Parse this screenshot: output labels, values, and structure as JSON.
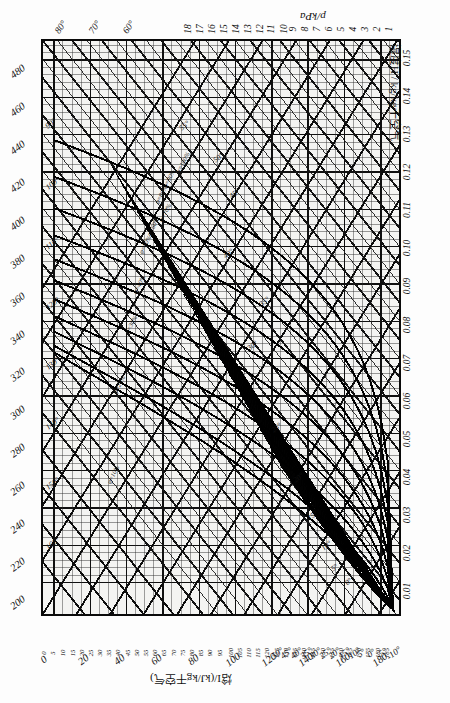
{
  "chart_data": {
    "type": "line",
    "orientation": "rotated-90-ccw",
    "axes": {
      "enthalpy": {
        "symbol": "I",
        "label": "焓I/(kJ/kg干空气)",
        "unit": "kJ/kg干空气",
        "major_ticks_left": [
          200,
          220,
          240,
          260,
          280,
          300,
          320,
          340,
          360,
          380,
          400,
          420,
          440,
          460,
          480
        ],
        "bottom_big_ticks": [
          180,
          160,
          140,
          120,
          100,
          80,
          60,
          40,
          20,
          0
        ],
        "bottom_small_ladder": [
          185,
          180,
          175,
          170,
          165,
          160,
          155,
          150,
          145,
          140,
          135,
          130,
          125,
          120,
          115,
          110,
          105,
          100,
          95,
          90,
          85,
          80,
          75,
          70,
          65,
          60,
          55,
          50,
          45,
          40,
          35,
          30,
          25,
          20,
          15,
          10,
          5,
          0
        ],
        "range": [
          0,
          490
        ]
      },
      "humidity": {
        "symbol": "H",
        "label": "湿度H / kg/kg干空气",
        "unit": "kg/kg干空气",
        "ticks": [
          "0.01",
          "0.02",
          "0.03",
          "0.04",
          "0.05",
          "0.06",
          "0.07",
          "0.08",
          "0.09",
          "0.10",
          "0.11",
          "0.12",
          "0.13",
          "0.14",
          "0.15"
        ],
        "range": [
          0,
          0.155
        ]
      },
      "pressure": {
        "symbol": "p",
        "label": "p/kPa",
        "unit": "kPa",
        "ticks": [
          18,
          17,
          16,
          15,
          14,
          13,
          12,
          11,
          10,
          9,
          8,
          7,
          6,
          5,
          4,
          3,
          2,
          1
        ],
        "range": [
          0,
          18.5
        ]
      },
      "temperature": {
        "symbol": "t",
        "unit": "°C",
        "bottom_ticks": [
          "-10°",
          "-5°",
          "0°",
          "5°",
          "10°",
          "15°",
          "20°",
          "25°",
          "30°",
          "35°",
          "40°",
          "45°",
          "50°"
        ],
        "top_ticks": [
          "60°",
          "70°",
          "80°"
        ],
        "left_isotherm_labels": [
          "90°",
          "100°",
          "110°",
          "120°",
          "130°",
          "140°",
          "150°",
          "160°"
        ],
        "range": [
          -10,
          180
        ]
      }
    },
    "relative_humidity_curves": {
      "symbol": "φ",
      "labels": [
        "φ=100%",
        "φ=90%",
        "φ=80%",
        "φ=70%",
        "φ=60%",
        "φ=50%",
        "φ=40%",
        "φ=30%",
        "φ=20%",
        "φ=10%",
        "φ=5%"
      ],
      "values": [
        100,
        90,
        80,
        70,
        60,
        50,
        40,
        30,
        20,
        10,
        5
      ]
    },
    "isotherm_labels_in_plot": [
      "55°",
      "50°",
      "45°",
      "40°",
      "35°",
      "30°",
      "25°",
      "20°",
      "15°",
      "10°",
      "5°",
      "0°"
    ],
    "grid": true,
    "legend": "none",
    "colors": {
      "line": "#0a0a0a",
      "grid": "#1a1a1a",
      "background": "#f4f4f2",
      "paper": "#fdfdfd",
      "saturation_fill": "#111111"
    }
  },
  "captions": {
    "pressure_axis": "p/kPa",
    "humidity_axis": "湿度H / kg/kg干空气",
    "enthalpy_axis": "焓I/(kJ/kg干空气)"
  }
}
